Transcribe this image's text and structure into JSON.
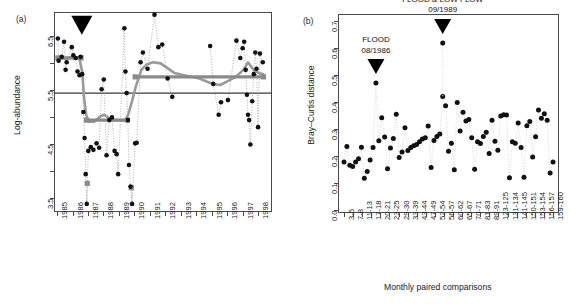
{
  "figure": {
    "panel_a_label": "(a)",
    "panel_b_label": "(b)"
  },
  "chart_data": [
    {
      "id": "panel_a",
      "type": "scatter",
      "title": "",
      "xlabel": "",
      "ylabel": "Log-abundance",
      "xlim": [
        1984.8,
        1998.9
      ],
      "ylim": [
        3.25,
        6.95
      ],
      "yticks": [
        3.5,
        4.5,
        5.5,
        6.5
      ],
      "ytick_labels": [
        "3.5",
        "4.5",
        "5.5",
        "6.5"
      ],
      "yticks_minor": [
        4.0,
        5.0,
        6.0
      ],
      "xticks": [
        1985,
        1986,
        1987,
        1988,
        1989,
        1990,
        1991,
        1992,
        1993,
        1994,
        1995,
        1996,
        1997,
        1998
      ],
      "xtick_labels": [
        "1985",
        "1986",
        "1987",
        "1988",
        "1989",
        "1990",
        "1991",
        "1992",
        "1993",
        "1994",
        "1995",
        "1996",
        "1997",
        "1998"
      ],
      "grid": false,
      "reference_line_y": 5.45,
      "marker_color": "#111111",
      "trend_color": "#9a9a9a",
      "level_color": "#8a8a8a",
      "connector_style": "dotted",
      "annotation_arrow": {
        "x": 1986.6,
        "y": 6.62,
        "shape": "down-triangle",
        "color": "#000000"
      },
      "points": [
        {
          "x": 1985.05,
          "y": 6.46
        },
        {
          "x": 1985.1,
          "y": 6.05
        },
        {
          "x": 1985.3,
          "y": 6.12
        },
        {
          "x": 1985.45,
          "y": 6.4
        },
        {
          "x": 1985.55,
          "y": 5.88
        },
        {
          "x": 1985.62,
          "y": 6.02
        },
        {
          "x": 1985.95,
          "y": 6.3
        },
        {
          "x": 1986.05,
          "y": 6.15
        },
        {
          "x": 1986.2,
          "y": 6.1
        },
        {
          "x": 1986.32,
          "y": 5.85
        },
        {
          "x": 1986.45,
          "y": 5.78
        },
        {
          "x": 1986.52,
          "y": 6.12
        },
        {
          "x": 1986.62,
          "y": 5.8
        },
        {
          "x": 1986.7,
          "y": 5.1
        },
        {
          "x": 1986.78,
          "y": 4.62
        },
        {
          "x": 1986.85,
          "y": 3.95
        },
        {
          "x": 1986.92,
          "y": 3.4
        },
        {
          "x": 1987.02,
          "y": 4.38
        },
        {
          "x": 1987.18,
          "y": 4.45
        },
        {
          "x": 1987.35,
          "y": 4.4
        },
        {
          "x": 1987.55,
          "y": 4.52
        },
        {
          "x": 1987.72,
          "y": 4.44
        },
        {
          "x": 1987.88,
          "y": 5.52
        },
        {
          "x": 1988.02,
          "y": 5.7
        },
        {
          "x": 1988.2,
          "y": 4.3
        },
        {
          "x": 1988.38,
          "y": 4.95
        },
        {
          "x": 1988.55,
          "y": 5.0
        },
        {
          "x": 1988.72,
          "y": 4.38
        },
        {
          "x": 1988.85,
          "y": 4.32
        },
        {
          "x": 1988.95,
          "y": 3.95
        },
        {
          "x": 1989.35,
          "y": 6.65
        },
        {
          "x": 1989.42,
          "y": 5.85
        },
        {
          "x": 1989.5,
          "y": 5.45
        },
        {
          "x": 1989.58,
          "y": 4.95
        },
        {
          "x": 1989.65,
          "y": 4.12
        },
        {
          "x": 1989.75,
          "y": 3.72
        },
        {
          "x": 1989.85,
          "y": 3.4
        },
        {
          "x": 1990.05,
          "y": 4.52
        },
        {
          "x": 1990.15,
          "y": 4.53
        },
        {
          "x": 1990.4,
          "y": 6.02
        },
        {
          "x": 1990.55,
          "y": 6.2
        },
        {
          "x": 1990.85,
          "y": 5.9
        },
        {
          "x": 1991.3,
          "y": 6.9
        },
        {
          "x": 1991.55,
          "y": 6.3
        },
        {
          "x": 1991.8,
          "y": 6.35
        },
        {
          "x": 1992.15,
          "y": 5.72
        },
        {
          "x": 1992.45,
          "y": 5.38
        },
        {
          "x": 1994.9,
          "y": 6.32
        },
        {
          "x": 1995.1,
          "y": 5.62
        },
        {
          "x": 1995.45,
          "y": 5.05
        },
        {
          "x": 1995.6,
          "y": 5.28
        },
        {
          "x": 1996.05,
          "y": 5.32
        },
        {
          "x": 1996.6,
          "y": 6.42
        },
        {
          "x": 1996.85,
          "y": 6.1
        },
        {
          "x": 1997.0,
          "y": 6.28
        },
        {
          "x": 1997.1,
          "y": 6.4
        },
        {
          "x": 1997.2,
          "y": 5.88
        },
        {
          "x": 1997.28,
          "y": 5.42
        },
        {
          "x": 1997.35,
          "y": 5.05
        },
        {
          "x": 1997.42,
          "y": 4.95
        },
        {
          "x": 1997.5,
          "y": 4.5
        },
        {
          "x": 1997.62,
          "y": 5.3
        },
        {
          "x": 1997.72,
          "y": 5.8
        },
        {
          "x": 1997.82,
          "y": 6.2
        },
        {
          "x": 1997.9,
          "y": 5.9
        },
        {
          "x": 1998.0,
          "y": 4.82
        },
        {
          "x": 1998.12,
          "y": 6.18
        },
        {
          "x": 1998.3,
          "y": 6.02
        }
      ],
      "square_markers": [
        {
          "x": 1985.05,
          "y": 6.1
        },
        {
          "x": 1986.55,
          "y": 6.1
        },
        {
          "x": 1986.95,
          "y": 3.78
        },
        {
          "x": 1989.8,
          "y": 3.7
        },
        {
          "x": 1986.9,
          "y": 4.95
        },
        {
          "x": 1989.55,
          "y": 4.95
        },
        {
          "x": 1990.05,
          "y": 5.75
        },
        {
          "x": 1998.35,
          "y": 5.75
        }
      ],
      "level_segments": [
        {
          "x0": 1985.05,
          "x1": 1986.55,
          "y": 6.1
        },
        {
          "x0": 1986.9,
          "x1": 1989.55,
          "y": 4.95
        },
        {
          "x0": 1990.05,
          "x1": 1998.35,
          "y": 5.75
        }
      ],
      "trend_line": [
        {
          "x": 1985.05,
          "y": 6.11
        },
        {
          "x": 1985.5,
          "y": 6.09
        },
        {
          "x": 1986.1,
          "y": 6.12
        },
        {
          "x": 1986.45,
          "y": 6.08
        },
        {
          "x": 1986.62,
          "y": 5.85
        },
        {
          "x": 1986.75,
          "y": 5.35
        },
        {
          "x": 1986.88,
          "y": 5.05
        },
        {
          "x": 1987.02,
          "y": 4.92
        },
        {
          "x": 1987.4,
          "y": 4.92
        },
        {
          "x": 1987.8,
          "y": 5.02
        },
        {
          "x": 1988.05,
          "y": 5.05
        },
        {
          "x": 1988.3,
          "y": 5.0
        },
        {
          "x": 1988.6,
          "y": 4.95
        },
        {
          "x": 1989.05,
          "y": 4.95
        },
        {
          "x": 1989.4,
          "y": 4.95
        },
        {
          "x": 1989.6,
          "y": 5.05
        },
        {
          "x": 1989.85,
          "y": 5.3
        },
        {
          "x": 1990.1,
          "y": 5.58
        },
        {
          "x": 1990.45,
          "y": 5.88
        },
        {
          "x": 1990.8,
          "y": 5.98
        },
        {
          "x": 1991.2,
          "y": 6.02
        },
        {
          "x": 1991.7,
          "y": 6.0
        },
        {
          "x": 1992.1,
          "y": 5.92
        },
        {
          "x": 1992.6,
          "y": 5.82
        },
        {
          "x": 1993.2,
          "y": 5.78
        },
        {
          "x": 1994.2,
          "y": 5.72
        },
        {
          "x": 1995.05,
          "y": 5.62
        },
        {
          "x": 1995.55,
          "y": 5.6
        },
        {
          "x": 1996.1,
          "y": 5.68
        },
        {
          "x": 1996.6,
          "y": 5.76
        },
        {
          "x": 1997.05,
          "y": 5.88
        },
        {
          "x": 1997.35,
          "y": 6.02
        },
        {
          "x": 1997.7,
          "y": 5.88
        },
        {
          "x": 1998.05,
          "y": 5.82
        },
        {
          "x": 1998.35,
          "y": 5.8
        }
      ]
    },
    {
      "id": "panel_b",
      "type": "scatter",
      "title": "",
      "xlabel": "Monthly paired comparisons",
      "ylabel": "Bray–Curtis distance",
      "ylim": [
        -0.01,
        0.725
      ],
      "yticks": [
        0.0,
        0.1,
        0.2,
        0.3,
        0.4,
        0.5,
        0.6,
        0.7
      ],
      "ytick_labels": [
        "0.0",
        "0.1",
        "0.2",
        "0.3",
        "0.4",
        "0.5",
        "0.6",
        "0.7"
      ],
      "grid": false,
      "marker_color": "#111111",
      "connector_color": "#d6d6d6",
      "xtick_labels": [
        "3-5",
        "7-8",
        "11-13",
        "17-18",
        "20-21",
        "23-25",
        "29-30",
        "33-39",
        "43-44",
        "47-49",
        "52-54",
        "56-57",
        "60-62",
        "65-67",
        "70-71",
        "81-83",
        "89-91",
        "123-125",
        "131-134",
        "141-145",
        "150-151",
        "153-154",
        "156-157",
        "159-160"
      ],
      "n_points": 72,
      "values": [
        0.178,
        0.236,
        0.166,
        0.162,
        0.178,
        0.19,
        0.233,
        0.118,
        0.143,
        0.186,
        0.232,
        0.47,
        0.257,
        0.342,
        0.271,
        0.153,
        0.23,
        0.265,
        0.355,
        0.195,
        0.215,
        0.305,
        0.221,
        0.232,
        0.238,
        0.243,
        0.253,
        0.263,
        0.268,
        0.311,
        0.158,
        0.258,
        0.273,
        0.282,
        0.42,
        0.386,
        0.218,
        0.248,
        0.15,
        0.398,
        0.293,
        0.362,
        0.33,
        0.335,
        0.268,
        0.152,
        0.253,
        0.247,
        0.273,
        0.288,
        0.21,
        0.333,
        0.255,
        0.222,
        0.348,
        0.353,
        0.352,
        0.12,
        0.253,
        0.248,
        0.322,
        0.232,
        0.122,
        0.312,
        0.328,
        0.197,
        0.272,
        0.37,
        0.34,
        0.357,
        0.333,
        0.138,
        0.178
      ],
      "annotations": [
        {
          "label_line1": "FLOOD",
          "label_line2": "08/1986",
          "point_index": 11,
          "point_value": 0.47,
          "arrow": "down-triangle"
        },
        {
          "label_line1": "FLOOD & LOW FLOW",
          "label_line2": "09/1989",
          "point_index": 34,
          "point_value": 0.618,
          "arrow": "down-triangle"
        }
      ]
    }
  ]
}
